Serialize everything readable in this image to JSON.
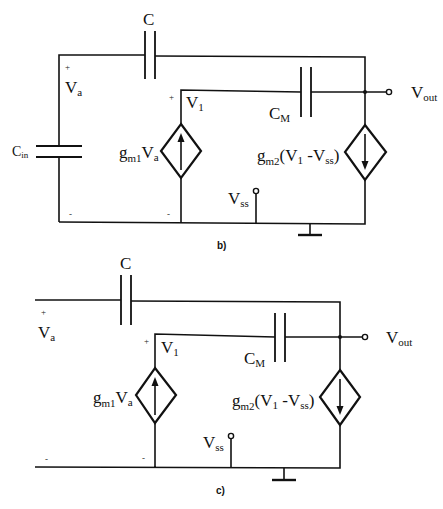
{
  "figure": {
    "background": "#ffffff",
    "line_color": "#111111"
  },
  "circuit_b": {
    "caption": "b)",
    "cap_c": {
      "main": "C"
    },
    "node_va": {
      "plus": "+",
      "main": "V",
      "sub": "a"
    },
    "node_v1": {
      "plus": "+",
      "main": "V",
      "sub": "1"
    },
    "cap_cm": {
      "main": "C",
      "sub": "M"
    },
    "cap_cin": {
      "main": "C",
      "sub": "in"
    },
    "source1": {
      "g": "g",
      "gsub": "m1",
      "v": "V",
      "vsub": "a",
      "direction": "up"
    },
    "source2": {
      "g": "g",
      "gsub": "m2",
      "open": "(V",
      "v1sub": "1",
      "mid": " -V",
      "vsssub": "ss",
      "close": ")",
      "direction": "down"
    },
    "vout": {
      "main": "V",
      "sub": "out"
    },
    "vss": {
      "main": "V",
      "sub": "ss"
    },
    "minus_left": "-",
    "minus_mid": "-"
  },
  "circuit_c": {
    "caption": "c)",
    "cap_c": {
      "main": "C"
    },
    "node_va": {
      "plus": "+",
      "main": "V",
      "sub": "a"
    },
    "node_v1": {
      "plus": "+",
      "main": "V",
      "sub": "1"
    },
    "cap_cm": {
      "main": "C",
      "sub": "M"
    },
    "source1": {
      "g": "g",
      "gsub": "m1",
      "v": "V",
      "vsub": "a",
      "direction": "up"
    },
    "source2": {
      "g": "g",
      "gsub": "m2",
      "open": "(V",
      "v1sub": "1",
      "mid": " -V",
      "vsssub": "ss",
      "close": ")",
      "direction": "down"
    },
    "vout": {
      "main": "V",
      "sub": "out"
    },
    "vss": {
      "main": "V",
      "sub": "ss"
    },
    "minus_left": "-",
    "minus_mid": "-"
  }
}
